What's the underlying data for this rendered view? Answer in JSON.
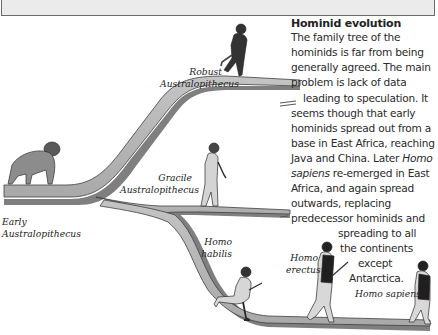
{
  "frame": {
    "top_box_color": "#ebebeb",
    "border_color": "#6a6a6a"
  },
  "panel": {
    "title": "Hominid evolution",
    "lines": [
      "The family tree of the",
      "hominids is far from being",
      "generally agreed. The main",
      "problem is lack of data",
      "leading to speculation. It",
      "seems though that early",
      "hominids spread out from a",
      "base in East Africa, reaching",
      "Java and China. Later ",
      "Homo",
      "sapiens",
      " re-emerged in East",
      "Africa, and again spread",
      "outwards, replacing",
      "predecessor hominids and",
      "spreading to all",
      "the continents",
      "except",
      "Antarctica."
    ]
  },
  "labels": {
    "robust": [
      "Robust",
      "Australopithecus"
    ],
    "gracile": [
      "Gracile",
      "Australopithecus"
    ],
    "early": [
      "Early",
      "Australopithecus"
    ],
    "habilis": [
      "Homo",
      "habilis"
    ],
    "erectus": [
      "Homo",
      "erectus"
    ],
    "sapiens": "Homo sapiens"
  },
  "colors": {
    "branch_fill": "#b8b8b8",
    "branch_shadow": "#7a7a7a",
    "branch_edge": "#444444",
    "figure": "#3a3a3a",
    "figure_light": "#cfcfcf"
  }
}
